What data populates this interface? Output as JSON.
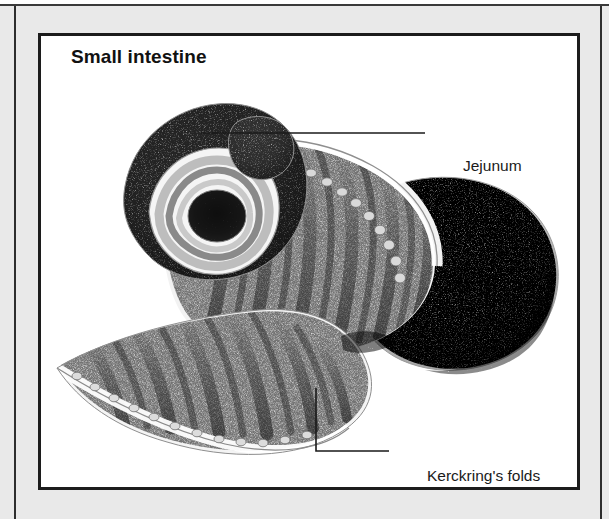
{
  "figure": {
    "title": "Small intestine",
    "type": "anatomical-illustration",
    "style": "black-and-white stipple / pen-and-ink medical drawing",
    "background_color": "#ffffff",
    "page_background_color": "#e9e9e9",
    "frame_color": "#1c1c1c",
    "ink_color": "#1a1a1a"
  },
  "labels": [
    {
      "id": "jejunum",
      "text": "Jejunum",
      "leader": "horizontal",
      "points_to": "upper rounded bulge of the intestinal loop"
    },
    {
      "id": "kerckrings-folds",
      "text": "Kerckring's folds",
      "leader": "elbow",
      "points_to": "transverse mucosal ridges on the opened flap"
    }
  ]
}
